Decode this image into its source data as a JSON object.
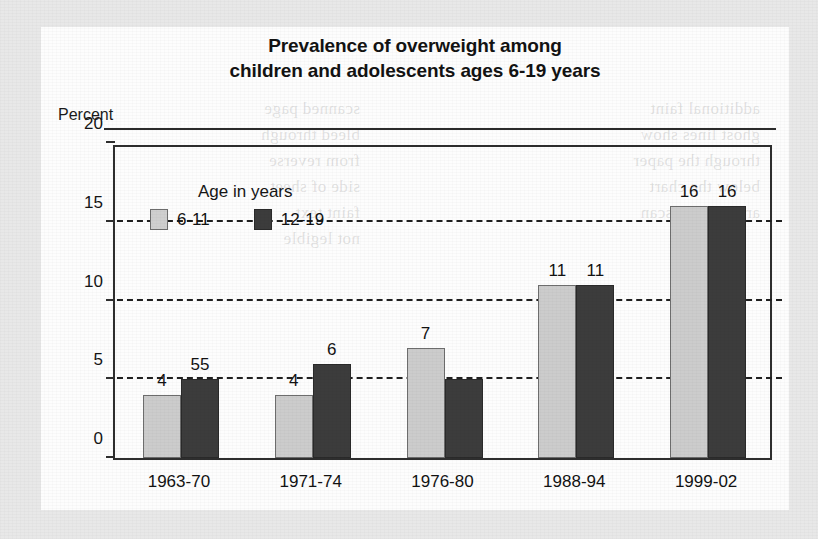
{
  "chart_data": {
    "type": "bar",
    "title": "Prevalence of overweight among children and adolescents ages 6-19 years",
    "title_lines": [
      "Prevalence of overweight among",
      "children and adolescents ages 6-19 years"
    ],
    "ylabel": "Percent",
    "xlabel": "",
    "ylim": [
      0,
      20
    ],
    "yticks": [
      0,
      5,
      10,
      15,
      20
    ],
    "ytick_labels": [
      "0",
      "5",
      "10",
      "15",
      "20"
    ],
    "grid": "horizontal-dashed",
    "gridline_values": [
      5,
      10,
      15
    ],
    "legend_position": "inside-top-left",
    "legend_title": "Age in years",
    "categories": [
      "1963-70",
      "1971-74",
      "1976-80",
      "1988-94",
      "1999-02"
    ],
    "series": [
      {
        "name": "6-11",
        "color": "#cccccc",
        "values": [
          4,
          4,
          7,
          11,
          16
        ],
        "labels": [
          "4",
          "4",
          "7",
          "11",
          "16"
        ]
      },
      {
        "name": "12-19",
        "color": "#3c3c3c",
        "values": [
          5,
          6,
          5,
          11,
          16
        ],
        "labels": [
          "55",
          "6",
          "",
          "11",
          "16"
        ]
      }
    ]
  },
  "ghost_text": {
    "left": "scanned page\nbleed through\nfrom reverse\nside of sheet\nfaint text\nnot legible",
    "right": "additional faint\nghost lines show\nthrough the paper\nbelow the chart\narea on this scan"
  }
}
